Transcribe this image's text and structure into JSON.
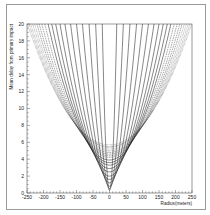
{
  "chart_data": {
    "type": "line",
    "title": "",
    "xlabel": "Radius(meters)",
    "ylabel": "Mean delay from primary impact",
    "xlim": [
      -250,
      250
    ],
    "ylim": [
      0,
      20
    ],
    "x_ticks": [
      -250,
      -200,
      -150,
      -100,
      -50,
      0,
      50,
      100,
      150,
      200,
      250
    ],
    "y_ticks": [
      0,
      2,
      4,
      6,
      8,
      10,
      12,
      14,
      16,
      18,
      20
    ],
    "grid": false,
    "legend": null,
    "series": [
      {
        "name": "curve-1",
        "style": "solid",
        "min_delay": 0.3,
        "radius_at_20": 22
      },
      {
        "name": "curve-2",
        "style": "solid",
        "min_delay": 0.5,
        "radius_at_20": 42
      },
      {
        "name": "curve-3",
        "style": "solid",
        "min_delay": 0.8,
        "radius_at_20": 62
      },
      {
        "name": "curve-4",
        "style": "solid",
        "min_delay": 1.2,
        "radius_at_20": 82
      },
      {
        "name": "curve-5",
        "style": "solid",
        "min_delay": 1.6,
        "radius_at_20": 100
      },
      {
        "name": "curve-6",
        "style": "solid",
        "min_delay": 2.0,
        "radius_at_20": 118
      },
      {
        "name": "curve-7",
        "style": "solid",
        "min_delay": 2.5,
        "radius_at_20": 135
      },
      {
        "name": "curve-8",
        "style": "solid",
        "min_delay": 2.9,
        "radius_at_20": 150
      },
      {
        "name": "curve-9",
        "style": "solid",
        "min_delay": 3.3,
        "radius_at_20": 163
      },
      {
        "name": "curve-10",
        "style": "solid",
        "min_delay": 3.6,
        "radius_at_20": 175
      },
      {
        "name": "curve-11",
        "style": "solid",
        "min_delay": 3.9,
        "radius_at_20": 186
      },
      {
        "name": "curve-12",
        "style": "dashed",
        "min_delay": 4.2,
        "radius_at_20": 196
      },
      {
        "name": "curve-13",
        "style": "dashed",
        "min_delay": 4.4,
        "radius_at_20": 205
      },
      {
        "name": "curve-14",
        "style": "dashed",
        "min_delay": 4.6,
        "radius_at_20": 213
      },
      {
        "name": "curve-15",
        "style": "dashed",
        "min_delay": 4.8,
        "radius_at_20": 220
      },
      {
        "name": "curve-16",
        "style": "dotted",
        "min_delay": 5.0,
        "radius_at_20": 227
      },
      {
        "name": "curve-17",
        "style": "dotted",
        "min_delay": 5.2,
        "radius_at_20": 233
      },
      {
        "name": "curve-18",
        "style": "dotted",
        "min_delay": 5.4,
        "radius_at_20": 239
      },
      {
        "name": "curve-19",
        "style": "dotted",
        "min_delay": 5.5,
        "radius_at_20": 244
      },
      {
        "name": "curve-20",
        "style": "dotted",
        "min_delay": 5.7,
        "radius_at_20": 249
      }
    ]
  },
  "colors": {
    "line": "#222222",
    "frame": "#9a9a9a",
    "axis": "#555555"
  }
}
